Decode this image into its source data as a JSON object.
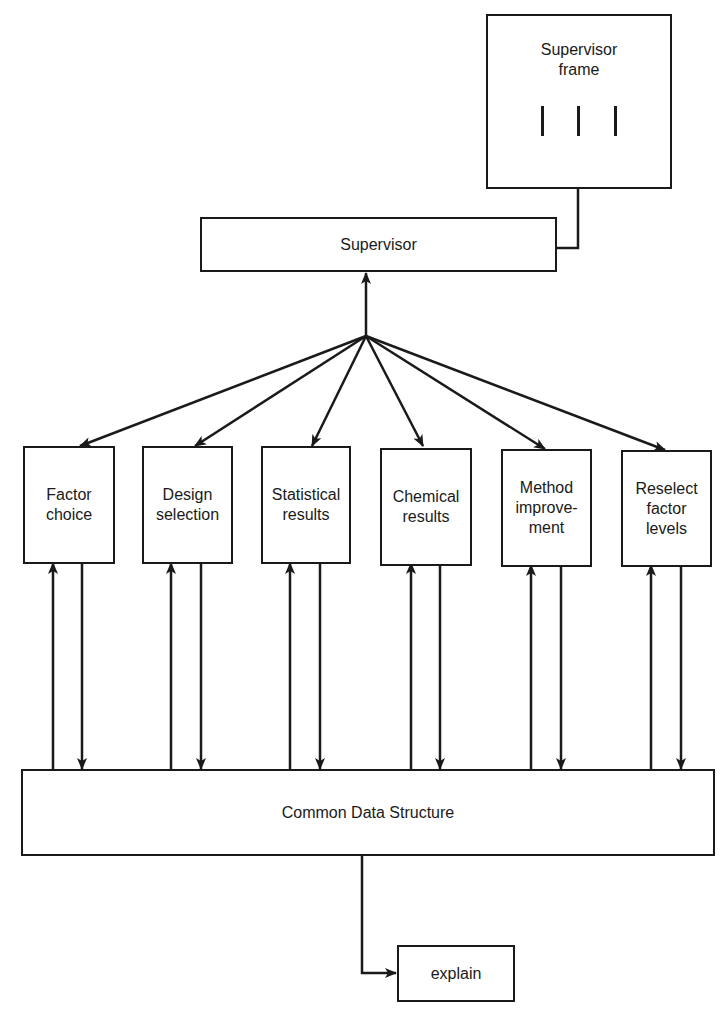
{
  "diagram": {
    "supervisor_frame": {
      "label": "Supervisor\nframe",
      "slots": 3
    },
    "supervisor": {
      "label": "Supervisor"
    },
    "modules": [
      {
        "id": "factor-choice",
        "label": "Factor\nchoice"
      },
      {
        "id": "design-selection",
        "label": "Design\nselection"
      },
      {
        "id": "statistical-results",
        "label": "Statistical\nresults"
      },
      {
        "id": "chemical-results",
        "label": "Chemical\nresults"
      },
      {
        "id": "method-improvement",
        "label": "Method\nimprove-\nment"
      },
      {
        "id": "reselect-factor-levels",
        "label": "Reselect\nfactor\nlevels"
      }
    ],
    "common_data_structure": {
      "label": "Common Data Structure"
    },
    "explain": {
      "label": "explain"
    },
    "colors": {
      "ink": "#1a1a1a",
      "background": "#ffffff"
    }
  }
}
